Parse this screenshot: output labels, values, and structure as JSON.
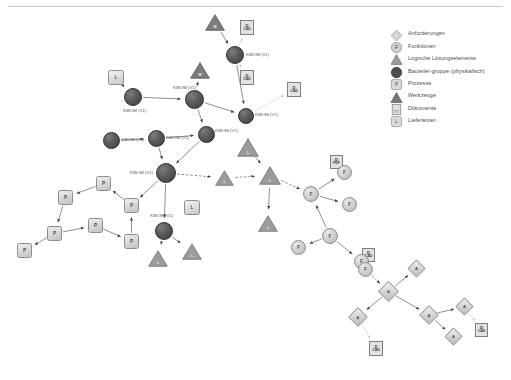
{
  "legend": {
    "items": [
      {
        "icon": "diamond-icon",
        "label": "Anforderungen"
      },
      {
        "icon": "circle-f-icon",
        "label": "Funktionen"
      },
      {
        "icon": "triangle-icon",
        "label": "Logische Lösungselemente"
      },
      {
        "icon": "filled-circle-icon",
        "label": "Bauteile/-gruppe (physikalisch)"
      },
      {
        "icon": "square-p-icon",
        "label": "Prozesse"
      },
      {
        "icon": "dark-triangle-icon",
        "label": "Werkzeuge"
      },
      {
        "icon": "document-icon",
        "label": "Dokumente"
      },
      {
        "icon": "square-l-icon",
        "label": "Lieferanten"
      }
    ]
  },
  "graph": {
    "nodes": [
      {
        "id": "t1",
        "type": "tool",
        "name": "tool-node-top-left",
        "x": 205,
        "y": 14,
        "w": 20,
        "h": 17,
        "glyph": "W"
      },
      {
        "id": "t2",
        "type": "tool",
        "name": "tool-node-upper-mid",
        "x": 190,
        "y": 62,
        "w": 20,
        "h": 17,
        "glyph": "W"
      },
      {
        "id": "d1",
        "type": "document",
        "name": "document-node-cad-1",
        "x": 240,
        "y": 20,
        "w": 14,
        "h": 15,
        "line1": "D",
        "line2": "CAD"
      },
      {
        "id": "d2",
        "type": "document",
        "name": "document-node-cad-2",
        "x": 240,
        "y": 70,
        "w": 14,
        "h": 15,
        "line1": "D",
        "line2": "CAD"
      },
      {
        "id": "d3",
        "type": "document",
        "name": "document-node-cad-3",
        "x": 287,
        "y": 82,
        "w": 14,
        "h": 15,
        "line1": "D",
        "line2": "CAD"
      },
      {
        "id": "d4",
        "type": "document",
        "name": "document-node-pdf",
        "x": 330,
        "y": 155,
        "w": 13,
        "h": 14,
        "line1": "D",
        "line2": "PDF"
      },
      {
        "id": "d5",
        "type": "document",
        "name": "document-node-cad-4",
        "x": 362,
        "y": 248,
        "w": 13,
        "h": 14,
        "line1": "D",
        "line2": "CAD"
      },
      {
        "id": "d6",
        "type": "document",
        "name": "document-node-bottom",
        "x": 369,
        "y": 341,
        "w": 14,
        "h": 15,
        "line1": "D",
        "line2": "CAD"
      },
      {
        "id": "d7",
        "type": "document",
        "name": "document-node-right",
        "x": 475,
        "y": 323,
        "w": 13,
        "h": 14,
        "line1": "D",
        "line2": "CAD"
      },
      {
        "id": "s1",
        "type": "supplier",
        "name": "supplier-node-left",
        "x": 108,
        "y": 70,
        "w": 16,
        "h": 15,
        "glyph": "L"
      },
      {
        "id": "s2",
        "type": "supplier",
        "name": "supplier-node-center",
        "x": 184,
        "y": 200,
        "w": 16,
        "h": 15,
        "glyph": "L"
      },
      {
        "id": "b1",
        "type": "part",
        "name": "part-node-kibom-1",
        "x": 226,
        "y": 46,
        "w": 18,
        "h": 18,
        "label": "KIBOM (V1)",
        "lx": 20,
        "ly": 7
      },
      {
        "id": "b2",
        "type": "part",
        "name": "part-node-kibom-2",
        "x": 124,
        "y": 88,
        "w": 18,
        "h": 18,
        "label": "KIBOM (V1)",
        "lx": -1,
        "ly": 21
      },
      {
        "id": "b3",
        "type": "part",
        "name": "part-node-kibom-3",
        "x": 185,
        "y": 90,
        "w": 19,
        "h": 19,
        "label": "KIBOM (V1)",
        "lx": -12,
        "ly": -4
      },
      {
        "id": "b4",
        "type": "part",
        "name": "part-node-kibom-4",
        "x": 238,
        "y": 108,
        "w": 16,
        "h": 16,
        "label": "KIBOM (V1)",
        "lx": 17,
        "ly": 5
      },
      {
        "id": "b5",
        "type": "part",
        "name": "part-node-kibom-5",
        "x": 103,
        "y": 132,
        "w": 17,
        "h": 17,
        "label": "KIBOM (V1)",
        "lx": 18,
        "ly": 6
      },
      {
        "id": "b6",
        "type": "part",
        "name": "part-node-kibom-6",
        "x": 148,
        "y": 130,
        "w": 17,
        "h": 17,
        "label": "KIBOM (V1)",
        "lx": 18,
        "ly": 6
      },
      {
        "id": "b7",
        "type": "part",
        "name": "part-node-kibom-7",
        "x": 198,
        "y": 126,
        "w": 17,
        "h": 17,
        "label": "KIBOM (V1)",
        "lx": 17,
        "ly": 3
      },
      {
        "id": "b8",
        "type": "part",
        "name": "part-node-kibom-hub",
        "x": 156,
        "y": 163,
        "w": 20,
        "h": 20,
        "label": "KIBOM (V1)",
        "lx": -26,
        "ly": 8
      },
      {
        "id": "b9",
        "type": "part",
        "name": "part-node-kibom-lower",
        "x": 155,
        "y": 222,
        "w": 18,
        "h": 18,
        "label": "KIBOM (V1)",
        "lx": -5,
        "ly": -8
      },
      {
        "id": "l1",
        "type": "logic",
        "name": "logic-node-center-1",
        "x": 237,
        "y": 138,
        "w": 22,
        "h": 19,
        "glyph": "L"
      },
      {
        "id": "l2",
        "type": "logic",
        "name": "logic-node-center-2",
        "x": 259,
        "y": 166,
        "w": 22,
        "h": 19,
        "glyph": "L"
      },
      {
        "id": "l3",
        "type": "logic",
        "name": "logic-node-center-3",
        "x": 215,
        "y": 170,
        "w": 19,
        "h": 16,
        "glyph": "L"
      },
      {
        "id": "l4",
        "type": "logic",
        "name": "logic-node-lower-1",
        "x": 148,
        "y": 250,
        "w": 20,
        "h": 17,
        "glyph": "L"
      },
      {
        "id": "l5",
        "type": "logic",
        "name": "logic-node-lower-2",
        "x": 182,
        "y": 243,
        "w": 20,
        "h": 17,
        "glyph": "L"
      },
      {
        "id": "l6",
        "type": "logic",
        "name": "logic-node-right",
        "x": 258,
        "y": 215,
        "w": 20,
        "h": 17,
        "glyph": "L"
      },
      {
        "id": "p1",
        "type": "process",
        "name": "process-node-1",
        "x": 96,
        "y": 176,
        "w": 15,
        "h": 15,
        "glyph": "P"
      },
      {
        "id": "p2",
        "type": "process",
        "name": "process-node-2",
        "x": 58,
        "y": 190,
        "w": 15,
        "h": 15,
        "glyph": "P"
      },
      {
        "id": "p3",
        "type": "process",
        "name": "process-node-3",
        "x": 47,
        "y": 226,
        "w": 15,
        "h": 15,
        "glyph": "P"
      },
      {
        "id": "p4",
        "type": "process",
        "name": "process-node-4",
        "x": 17,
        "y": 243,
        "w": 15,
        "h": 15,
        "glyph": "P"
      },
      {
        "id": "p5",
        "type": "process",
        "name": "process-node-5",
        "x": 88,
        "y": 218,
        "w": 15,
        "h": 15,
        "glyph": "P"
      },
      {
        "id": "p6",
        "type": "process",
        "name": "process-node-6",
        "x": 124,
        "y": 198,
        "w": 15,
        "h": 15,
        "glyph": "P"
      },
      {
        "id": "p7",
        "type": "process",
        "name": "process-node-7",
        "x": 124,
        "y": 234,
        "w": 15,
        "h": 15,
        "glyph": "P"
      },
      {
        "id": "f1",
        "type": "function",
        "name": "function-node-1",
        "x": 303,
        "y": 186,
        "w": 16,
        "h": 16,
        "glyph": "F"
      },
      {
        "id": "f2",
        "type": "function",
        "name": "function-node-2",
        "x": 337,
        "y": 165,
        "w": 15,
        "h": 15,
        "glyph": "F"
      },
      {
        "id": "f3",
        "type": "function",
        "name": "function-node-3",
        "x": 342,
        "y": 197,
        "w": 15,
        "h": 15,
        "glyph": "F"
      },
      {
        "id": "f4",
        "type": "function",
        "name": "function-node-4",
        "x": 322,
        "y": 228,
        "w": 16,
        "h": 16,
        "glyph": "F"
      },
      {
        "id": "f5",
        "type": "function",
        "name": "function-node-5",
        "x": 291,
        "y": 240,
        "w": 15,
        "h": 15,
        "glyph": "F"
      },
      {
        "id": "f6",
        "type": "function",
        "name": "function-node-6",
        "x": 354,
        "y": 254,
        "w": 15,
        "h": 15,
        "glyph": "F"
      },
      {
        "id": "f7",
        "type": "function",
        "name": "function-node-7",
        "x": 358,
        "y": 262,
        "w": 15,
        "h": 15,
        "glyph": "F"
      },
      {
        "id": "a1",
        "type": "req",
        "name": "requirement-node-hub",
        "x": 381,
        "y": 284,
        "w": 15,
        "h": 15,
        "glyph": "A"
      },
      {
        "id": "a2",
        "type": "req",
        "name": "requirement-node-top",
        "x": 410,
        "y": 262,
        "w": 13,
        "h": 13,
        "glyph": "A"
      },
      {
        "id": "a3",
        "type": "req",
        "name": "requirement-node-left",
        "x": 351,
        "y": 310,
        "w": 14,
        "h": 14,
        "glyph": "A"
      },
      {
        "id": "a4",
        "type": "req",
        "name": "requirement-node-mid",
        "x": 422,
        "y": 308,
        "w": 14,
        "h": 14,
        "glyph": "A"
      },
      {
        "id": "a5",
        "type": "req",
        "name": "requirement-node-right",
        "x": 458,
        "y": 300,
        "w": 13,
        "h": 13,
        "glyph": "A"
      },
      {
        "id": "a6",
        "type": "req",
        "name": "requirement-node-bottom",
        "x": 447,
        "y": 330,
        "w": 13,
        "h": 13,
        "glyph": "A"
      }
    ],
    "edges": [
      {
        "from": "t1",
        "to": "b1",
        "style": "solid"
      },
      {
        "from": "t2",
        "to": "b3",
        "style": "solid"
      },
      {
        "from": "b1",
        "to": "d1",
        "style": "light"
      },
      {
        "from": "b1",
        "to": "d2",
        "style": "light"
      },
      {
        "from": "b4",
        "to": "d3",
        "style": "light"
      },
      {
        "from": "s1",
        "to": "b2",
        "style": "solid"
      },
      {
        "from": "b1",
        "to": "b4",
        "style": "solid"
      },
      {
        "from": "b3",
        "to": "b4",
        "style": "solid"
      },
      {
        "from": "b2",
        "to": "b3",
        "style": "solid"
      },
      {
        "from": "b5",
        "to": "b6",
        "style": "solid"
      },
      {
        "from": "b6",
        "to": "b7",
        "style": "solid"
      },
      {
        "from": "b3",
        "to": "b7",
        "style": "solid"
      },
      {
        "from": "b6",
        "to": "b8",
        "style": "solid"
      },
      {
        "from": "b7",
        "to": "b8",
        "style": "solid"
      },
      {
        "from": "b8",
        "to": "b9",
        "style": "solid"
      },
      {
        "from": "b8",
        "to": "l3",
        "style": "dashed"
      },
      {
        "from": "l3",
        "to": "l2",
        "style": "dashed"
      },
      {
        "from": "l1",
        "to": "l2",
        "style": "solid"
      },
      {
        "from": "l2",
        "to": "f1",
        "style": "dashed"
      },
      {
        "from": "b8",
        "to": "p6",
        "style": "solid"
      },
      {
        "from": "p6",
        "to": "p1",
        "style": "solid"
      },
      {
        "from": "p1",
        "to": "p2",
        "style": "solid"
      },
      {
        "from": "p2",
        "to": "p3",
        "style": "solid"
      },
      {
        "from": "p3",
        "to": "p4",
        "style": "solid"
      },
      {
        "from": "p3",
        "to": "p5",
        "style": "solid"
      },
      {
        "from": "p5",
        "to": "p7",
        "style": "solid"
      },
      {
        "from": "p7",
        "to": "p6",
        "style": "solid"
      },
      {
        "from": "b9",
        "to": "l4",
        "style": "solid"
      },
      {
        "from": "b9",
        "to": "l5",
        "style": "solid"
      },
      {
        "from": "l2",
        "to": "l6",
        "style": "solid"
      },
      {
        "from": "f1",
        "to": "f2",
        "style": "solid"
      },
      {
        "from": "f1",
        "to": "f3",
        "style": "solid"
      },
      {
        "from": "f4",
        "to": "f1",
        "style": "solid"
      },
      {
        "from": "f4",
        "to": "f5",
        "style": "solid"
      },
      {
        "from": "f4",
        "to": "f6",
        "style": "solid"
      },
      {
        "from": "f2",
        "to": "d4",
        "style": "light"
      },
      {
        "from": "f7",
        "to": "a1",
        "style": "dashed"
      },
      {
        "from": "a1",
        "to": "a2",
        "style": "solid"
      },
      {
        "from": "a1",
        "to": "a3",
        "style": "solid"
      },
      {
        "from": "a1",
        "to": "a4",
        "style": "solid"
      },
      {
        "from": "a4",
        "to": "a5",
        "style": "solid"
      },
      {
        "from": "a4",
        "to": "a6",
        "style": "solid"
      },
      {
        "from": "a5",
        "to": "d7",
        "style": "light"
      },
      {
        "from": "a3",
        "to": "d6",
        "style": "light"
      },
      {
        "from": "f6",
        "to": "d5",
        "style": "light"
      }
    ]
  }
}
